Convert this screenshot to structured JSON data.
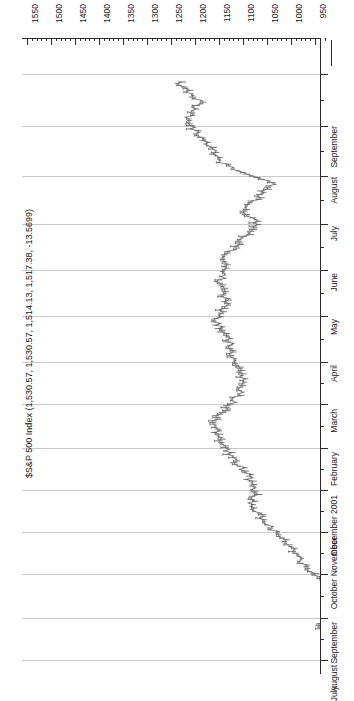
{
  "chart_data": {
    "type": "line",
    "title": "$S&P 500 Index (1,530.57, 1,530.57, 1,514.13, 1,517.38, -13.5699)",
    "subtitle": "",
    "xlabel": "",
    "ylabel": "",
    "orientation": "rotated-90",
    "grid": true,
    "legend": "none",
    "value_axis": {
      "position": "top",
      "direction": "descending-left-to-right",
      "ylim": [
        1550,
        950
      ],
      "major_step": 50,
      "minor_per_major": 5,
      "tick_labels": [
        "1550",
        "1500",
        "1450",
        "1400",
        "1350",
        "1300",
        "1250",
        "1200",
        "1150",
        "1100",
        "1050",
        "1000",
        "950"
      ]
    },
    "time_axis": {
      "position": "right",
      "direction": "latest-at-top",
      "tick_labels": [
        "September",
        "August",
        "July",
        "June",
        "May",
        "April",
        "March",
        "February",
        "December 2001",
        "November",
        "October",
        "September",
        "August",
        "July"
      ]
    },
    "quote": {
      "symbol": "$S&P 500 Index",
      "open": "1,530.57",
      "high": "1,530.57",
      "low": "1,514.13",
      "close": "1,517.38",
      "change": "-13.5699"
    },
    "series": [
      {
        "name": "$S&P 500 Index",
        "color": "#5a5a5a",
        "x": [
          "2001-07",
          "2001-07",
          "2001-07",
          "2001-07",
          "2001-08",
          "2001-08",
          "2001-08",
          "2001-08",
          "2001-09",
          "2001-09",
          "2001-09",
          "2001-09",
          "2001-10",
          "2001-10",
          "2001-10",
          "2001-10",
          "2001-11",
          "2001-11",
          "2001-11",
          "2001-11",
          "2001-12",
          "2001-12",
          "2001-12",
          "2001-12",
          "2002-01",
          "2002-01",
          "2002-01",
          "2002-01",
          "2002-02",
          "2002-02",
          "2002-02",
          "2002-02",
          "2002-03",
          "2002-03",
          "2002-03",
          "2002-03",
          "2002-04",
          "2002-04",
          "2002-04",
          "2002-04",
          "2002-05",
          "2002-05",
          "2002-05",
          "2002-05",
          "2002-06",
          "2002-06",
          "2002-06",
          "2002-06",
          "2002-07",
          "2002-07",
          "2002-07",
          "2002-07",
          "2002-08",
          "2002-08",
          "2002-08",
          "2002-08",
          "2002-09",
          "2002-09",
          "2002-09",
          "2002-09"
        ],
        "values": [
          1234,
          1212,
          1190,
          1206,
          1220,
          1196,
          1178,
          1162,
          1145,
          1104,
          1038,
          1060,
          1082,
          1098,
          1072,
          1090,
          1110,
          1130,
          1142,
          1138,
          1150,
          1144,
          1132,
          1148,
          1154,
          1138,
          1122,
          1130,
          1118,
          1106,
          1096,
          1110,
          1122,
          1148,
          1160,
          1152,
          1140,
          1126,
          1108,
          1090,
          1082,
          1072,
          1086,
          1066,
          1048,
          1026,
          1000,
          986,
          974,
          954,
          912,
          898,
          884,
          908,
          940,
          928,
          916,
          902,
          880,
          868
        ]
      }
    ]
  },
  "axis_geometry": {
    "value_ticks": [
      {
        "label": "1550",
        "x": 27
      },
      {
        "label": "1500",
        "x": 51
      },
      {
        "label": "1450",
        "x": 75
      },
      {
        "label": "1400",
        "x": 99
      },
      {
        "label": "1350",
        "x": 123
      },
      {
        "label": "1300",
        "x": 147
      },
      {
        "label": "1250",
        "x": 171
      },
      {
        "label": "1200",
        "x": 195
      },
      {
        "label": "1150",
        "x": 219
      },
      {
        "label": "1100",
        "x": 243
      },
      {
        "label": "1050",
        "x": 267
      },
      {
        "label": "1000",
        "x": 291
      },
      {
        "label": "950",
        "x": 315
      }
    ],
    "time_ticks": [
      {
        "label": "September",
        "y": 36
      },
      {
        "label": "August",
        "y": 88
      },
      {
        "label": "July",
        "y": 138
      },
      {
        "label": "June",
        "y": 186
      },
      {
        "label": "May",
        "y": 232
      },
      {
        "label": "April",
        "y": 278
      },
      {
        "label": "March",
        "y": 324
      },
      {
        "label": "February",
        "y": 366
      },
      {
        "label": "December 2001",
        "y": 410
      },
      {
        "label": "November",
        "y": 452
      },
      {
        "label": "October",
        "y": 494
      },
      {
        "label": "September",
        "y": 536
      },
      {
        "label": "August",
        "y": 580
      },
      {
        "label": "July",
        "y": 622
      }
    ]
  }
}
